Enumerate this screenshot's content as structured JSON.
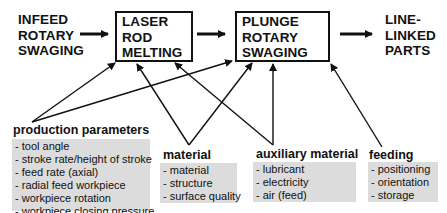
{
  "process_chain": {
    "stages": [
      {
        "id": "infeed",
        "lines": [
          "INFEED",
          "ROTARY",
          "SWAGING"
        ],
        "boxed": false
      },
      {
        "id": "laser",
        "lines": [
          "LASER",
          "ROD",
          "MELTING"
        ],
        "boxed": true
      },
      {
        "id": "plunge",
        "lines": [
          "PLUNGE",
          "ROTARY",
          "SWAGING"
        ],
        "boxed": true
      },
      {
        "id": "output",
        "lines": [
          "LINE-",
          "LINKED",
          "PARTS"
        ],
        "boxed": false
      }
    ]
  },
  "influence_groups": {
    "production_parameters": {
      "title": "production parameters",
      "items": [
        "- tool angle",
        "- stroke rate/height of stroke",
        "- feed rate (axial)",
        "- radial feed workpiece",
        "- workpiece rotation",
        "- workpiece closing pressure"
      ]
    },
    "material": {
      "title": "material",
      "items": [
        "- material",
        "- structure",
        "- surface quality"
      ]
    },
    "auxiliary_material": {
      "title": "auxiliary material",
      "items": [
        "- lubricant",
        "- electricity",
        "- air (feed)"
      ]
    },
    "feeding": {
      "title": "feeding",
      "items": [
        "- positioning",
        "- orientation",
        "- storage"
      ]
    }
  },
  "colors": {
    "line": "#111111",
    "list_background": "#dcdcdc"
  }
}
